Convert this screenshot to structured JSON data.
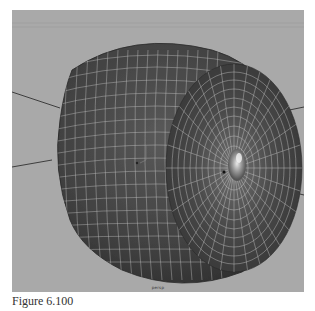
{
  "figure": {
    "caption": "Figure 6.100"
  },
  "viewport": {
    "camera_label": "persp",
    "background_color": "#a9a9a9",
    "model": {
      "type": "tire",
      "display": "wireframe-on-shaded",
      "mesh_color": "#4a4a4a",
      "wire_color": "#d8d8d8"
    }
  }
}
